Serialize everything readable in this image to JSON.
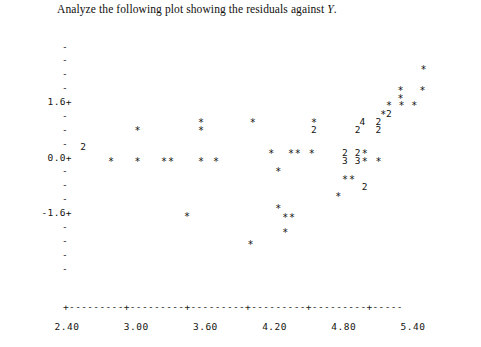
{
  "title": {
    "prefix": "Analyze the following plot showing the residuals against ",
    "variable": "Y",
    "hat": "ˆ",
    "suffix": ".",
    "full": "Analyze the following plot showing the residuals against Ŷ."
  },
  "axes": {
    "y_label_ticks": [
      {
        "label": "1.6+",
        "value": 1.6
      },
      {
        "label": "0.0+",
        "value": 0.0
      },
      {
        "label": "-1.6+",
        "value": -1.6
      }
    ],
    "y_minor_tick": "-",
    "y_minor_count_between": 3,
    "y_range": [
      -2.8,
      2.8
    ],
    "x_tick_labels": [
      "2.40",
      "3.00",
      "3.60",
      "4.20",
      "4.80",
      "5.40"
    ],
    "x_tick_values": [
      2.4,
      3.0,
      3.6,
      4.2,
      4.8,
      5.4
    ],
    "x_range": [
      2.4,
      5.76
    ],
    "x_axis_glyphs": "+---------+---------+---------+---------+---------+-----",
    "grid": "none",
    "legend": "none",
    "plot_style": "character-cell-scatter"
  },
  "colors": {
    "background": "#ffffff",
    "ink": "#16150f",
    "text": "#100f0d"
  },
  "chart_data": {
    "type": "scatter",
    "xlabel": "",
    "ylabel": "",
    "xlim": [
      2.4,
      5.76
    ],
    "ylim": [
      -2.8,
      2.8
    ],
    "grid": false,
    "legend_position": "none",
    "marker": "*",
    "note": "Numeric markers (2,3,4) denote that many overplotted points at that cell.",
    "points": [
      {
        "x": 5.5,
        "y": 2.55,
        "glyph": "*",
        "count": 1
      },
      {
        "x": 5.3,
        "y": 1.95,
        "glyph": "*",
        "count": 1
      },
      {
        "x": 5.49,
        "y": 1.95,
        "glyph": "*",
        "count": 1
      },
      {
        "x": 5.3,
        "y": 1.72,
        "glyph": "*",
        "count": 1
      },
      {
        "x": 5.2,
        "y": 1.5,
        "glyph": "*",
        "count": 1
      },
      {
        "x": 5.31,
        "y": 1.5,
        "glyph": "*",
        "count": 1
      },
      {
        "x": 5.42,
        "y": 1.5,
        "glyph": "*",
        "count": 1
      },
      {
        "x": 5.15,
        "y": 1.26,
        "glyph": "*",
        "count": 1
      },
      {
        "x": 5.2,
        "y": 1.26,
        "glyph": "2",
        "count": 2
      },
      {
        "x": 4.97,
        "y": 1.03,
        "glyph": "4",
        "count": 4
      },
      {
        "x": 5.11,
        "y": 1.03,
        "glyph": "2",
        "count": 2
      },
      {
        "x": 5.11,
        "y": 0.8,
        "glyph": "2",
        "count": 2
      },
      {
        "x": 3.57,
        "y": 1.03,
        "glyph": "*",
        "count": 1
      },
      {
        "x": 4.02,
        "y": 1.03,
        "glyph": "*",
        "count": 1
      },
      {
        "x": 4.55,
        "y": 1.03,
        "glyph": "*",
        "count": 1
      },
      {
        "x": 3.02,
        "y": 0.8,
        "glyph": "*",
        "count": 1
      },
      {
        "x": 3.57,
        "y": 0.8,
        "glyph": "*",
        "count": 1
      },
      {
        "x": 4.55,
        "y": 0.8,
        "glyph": "2",
        "count": 2
      },
      {
        "x": 4.93,
        "y": 0.8,
        "glyph": "2",
        "count": 2
      },
      {
        "x": 2.55,
        "y": 0.3,
        "glyph": "2",
        "count": 2
      },
      {
        "x": 4.18,
        "y": 0.12,
        "glyph": "*",
        "count": 1
      },
      {
        "x": 4.35,
        "y": 0.12,
        "glyph": "*",
        "count": 1
      },
      {
        "x": 4.41,
        "y": 0.12,
        "glyph": "*",
        "count": 1
      },
      {
        "x": 4.53,
        "y": 0.12,
        "glyph": "*",
        "count": 1
      },
      {
        "x": 4.82,
        "y": 0.12,
        "glyph": "2",
        "count": 2
      },
      {
        "x": 4.93,
        "y": 0.12,
        "glyph": "2",
        "count": 2
      },
      {
        "x": 4.99,
        "y": 0.12,
        "glyph": "*",
        "count": 1
      },
      {
        "x": 2.79,
        "y": -0.1,
        "glyph": "*",
        "count": 1
      },
      {
        "x": 3.02,
        "y": -0.1,
        "glyph": "*",
        "count": 1
      },
      {
        "x": 3.25,
        "y": -0.1,
        "glyph": "*",
        "count": 1
      },
      {
        "x": 3.31,
        "y": -0.1,
        "glyph": "*",
        "count": 1
      },
      {
        "x": 3.57,
        "y": -0.1,
        "glyph": "*",
        "count": 1
      },
      {
        "x": 3.7,
        "y": -0.1,
        "glyph": "*",
        "count": 1
      },
      {
        "x": 4.82,
        "y": -0.1,
        "glyph": "3",
        "count": 3
      },
      {
        "x": 4.93,
        "y": -0.1,
        "glyph": "3",
        "count": 3
      },
      {
        "x": 4.99,
        "y": -0.1,
        "glyph": "*",
        "count": 1
      },
      {
        "x": 5.11,
        "y": -0.1,
        "glyph": "*",
        "count": 1
      },
      {
        "x": 4.24,
        "y": -0.38,
        "glyph": "*",
        "count": 1
      },
      {
        "x": 4.82,
        "y": -0.62,
        "glyph": "*",
        "count": 1
      },
      {
        "x": 4.88,
        "y": -0.62,
        "glyph": "*",
        "count": 1
      },
      {
        "x": 4.99,
        "y": -0.85,
        "glyph": "2",
        "count": 2
      },
      {
        "x": 4.76,
        "y": -1.1,
        "glyph": "*",
        "count": 1
      },
      {
        "x": 4.24,
        "y": -1.45,
        "glyph": "*",
        "count": 1
      },
      {
        "x": 3.45,
        "y": -1.68,
        "glyph": "*",
        "count": 1
      },
      {
        "x": 4.3,
        "y": -1.72,
        "glyph": "*",
        "count": 1
      },
      {
        "x": 4.36,
        "y": -1.72,
        "glyph": "*",
        "count": 1
      },
      {
        "x": 4.3,
        "y": -2.15,
        "glyph": "*",
        "count": 1
      },
      {
        "x": 4.0,
        "y": -2.5,
        "glyph": "*",
        "count": 1
      }
    ]
  }
}
